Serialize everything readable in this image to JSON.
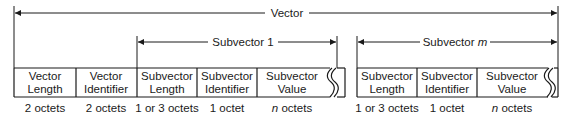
{
  "diagram": {
    "vector_label": "Vector",
    "subvector1_label": "Subvector 1",
    "subvectorm_label_prefix": "Subvector ",
    "subvectorm_label_var": "m",
    "fields": [
      {
        "line1": "Vector",
        "line2": "Length",
        "size": "2 octets"
      },
      {
        "line1": "Vector",
        "line2": "Identifier",
        "size": "2 octets"
      },
      {
        "line1": "Subvector",
        "line2": "Length",
        "size": "1 or 3 octets"
      },
      {
        "line1": "Subvector",
        "line2": "Identifier",
        "size": "1 octet"
      },
      {
        "line1": "Subvector",
        "line2": "Value",
        "size_var": "n",
        "size_rest": " octets"
      },
      {
        "line1": "Subvector",
        "line2": "Length",
        "size": "1 or 3 octets"
      },
      {
        "line1": "Subvector",
        "line2": "Identifier",
        "size": "1 octet"
      },
      {
        "line1": "Subvector",
        "line2": "Value",
        "size_var": "n",
        "size_rest": " octets"
      }
    ],
    "colors": {
      "line": "#1a1a1a",
      "background": "#ffffff"
    }
  }
}
